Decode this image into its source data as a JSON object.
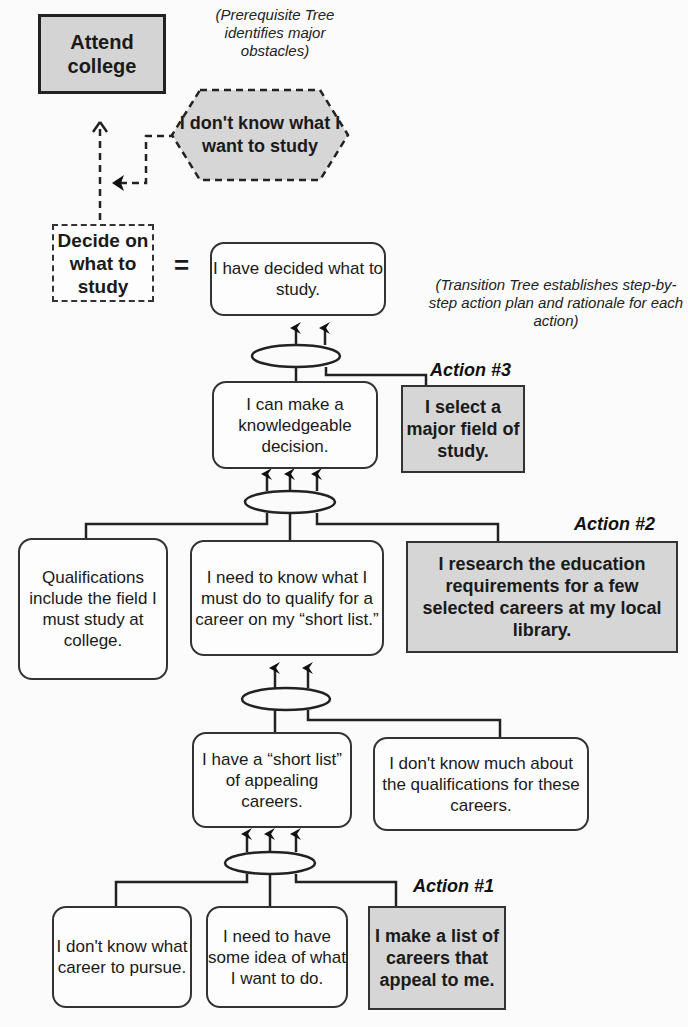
{
  "prerequisite_tree": {
    "note": "(Prerequisite Tree identifies major obstacles)",
    "goal": "Attend college",
    "obstacle": "I don't know what I want to study",
    "intermediate_objective": "Decide on what to study",
    "equals": "="
  },
  "transition_tree": {
    "note": "(Transition Tree establishes step-by-step action plan and rationale for each action)",
    "nodes": {
      "decided": "I have decided what to study.",
      "knowledgeable": "I can make a knowledgeable decision.",
      "qualifications_include": "Qualifications include the field I must study at college.",
      "need_to_know": "I need to know what I must do to qualify for a career on my “short list.”",
      "short_list": "I have a “short list” of appealing careers.",
      "dont_know_much": "I don't know much about the qualifications for these careers.",
      "dont_know_career": "I don't know what career to pursue.",
      "need_idea": "I need to have some idea of what I want to do."
    },
    "actions": [
      {
        "label": "Action #1",
        "text": "I make a list of careers that appeal to me."
      },
      {
        "label": "Action #2",
        "text": "I research the education requirements for a few selected careers at my local library."
      },
      {
        "label": "Action #3",
        "text": "I select a major field of study."
      }
    ]
  },
  "colors": {
    "action_fill": "#d6d6d6",
    "goal_fill": "#d4d4d4",
    "line": "#222222",
    "background": "#fbfbfb"
  }
}
